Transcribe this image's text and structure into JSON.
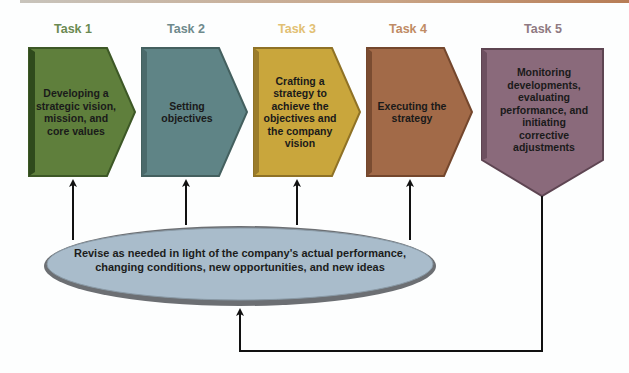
{
  "tasks": [
    {
      "label": "Task 1",
      "text": "Developing a strategic vision, mission, and core values",
      "color": "#5f7f3c",
      "label_color": "#6b8a52"
    },
    {
      "label": "Task 2",
      "text": "Setting objectives",
      "color": "#5f8486",
      "label_color": "#6e8a8c"
    },
    {
      "label": "Task 3",
      "text": "Crafting a strategy to achieve the objectives and the company vision",
      "color": "#c9a63c",
      "label_color": "#e2c073"
    },
    {
      "label": "Task 4",
      "text": "Executing the strategy",
      "color": "#a26a48",
      "label_color": "#c08b64"
    },
    {
      "label": "Task 5",
      "text": "Monitoring developments, evaluating performance, and initiating corrective adjustments",
      "color": "#8a6a7b",
      "label_color": "#8f7a82"
    }
  ],
  "feedback": {
    "text": "Revise as needed in light of the company's actual performance, changing conditions, new opportunities, and new ideas",
    "fill": "#a9bccb"
  }
}
